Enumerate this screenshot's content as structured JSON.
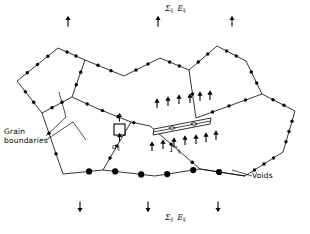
{
  "figure": {
    "type": "micromechanics-schematic",
    "width": 310,
    "height": 234,
    "background_color": "#ffffff",
    "line_color": "#000000"
  },
  "labels": {
    "top_load": {
      "stress_symbol": "Σ",
      "stress_sub": "ij",
      "strain_symbol": "E",
      "strain_sub": "ij"
    },
    "bottom_load": {
      "stress_symbol": "Σ",
      "stress_sub": "ij",
      "strain_symbol": "E",
      "strain_sub": "ij"
    },
    "grain_boundaries": {
      "line1": "Grain",
      "line2": "boundaries"
    },
    "voids": "Voids",
    "facet_band": {
      "symbol": "Γ",
      "sup": "*",
      "sub": "ij"
    },
    "local_stress": {
      "symbol": "σ",
      "sub": "ij"
    }
  },
  "legend_semantics": {
    "small_dots": "grain boundary cavity nuclei",
    "large_dots": "voids",
    "thin_band": "cavitating facet Γ*ij",
    "square": "representative volume element under local stress σij",
    "outer_arrows": "remote applied loading Σij / Eij",
    "band_arrows": "tractions on the cavitating facet"
  },
  "counts": {
    "top_load_arrows": 3,
    "bottom_load_arrows": 3,
    "grains": 5,
    "band_cavities": 2,
    "band_arrows_above": 6,
    "band_arrows_below": 7,
    "large_voids": 6
  },
  "geometry": {
    "grain_polygons": [
      {
        "name": "grain-upper-left",
        "points": "17,81 58,48 85,60 72,97 42,113"
      },
      {
        "name": "grain-lower-left",
        "points": "42,113 72,97 96,108 131,122 103,170 63,174"
      },
      {
        "name": "grain-center",
        "points": "85,60 124,76 160,58 189,70 196,118 150,126 131,122 96,108 72,97"
      },
      {
        "name": "grain-upper-right",
        "points": "189,70 217,46 246,61 262,94 219,108 196,118"
      },
      {
        "name": "grain-lower-right",
        "points": "196,118 262,94 295,111 283,152 245,176 200,169 150,126"
      }
    ],
    "boundary_edges": [
      {
        "name": "gb-edge-1",
        "path": "M17,81 L58,48",
        "node_count": 3
      },
      {
        "name": "gb-edge-2",
        "path": "M58,48 L85,60",
        "node_count": 2
      },
      {
        "name": "gb-edge-3",
        "path": "M85,60 L72,97",
        "node_count": 2
      },
      {
        "name": "gb-edge-4",
        "path": "M72,97 L42,113",
        "node_count": 2
      },
      {
        "name": "gb-edge-5",
        "path": "M42,113 L17,81",
        "node_count": 2
      },
      {
        "name": "gb-edge-6",
        "path": "M85,60 L124,76",
        "node_count": 2
      },
      {
        "name": "gb-edge-7",
        "path": "M124,76 L160,58",
        "node_count": 2
      },
      {
        "name": "gb-edge-8",
        "path": "M160,58 L189,70",
        "node_count": 2
      },
      {
        "name": "gb-edge-9",
        "path": "M189,70 L196,118",
        "node_count": 1
      },
      {
        "name": "gb-edge-10",
        "path": "M72,97 L96,108 L131,122 L150,126",
        "node_count": 4
      },
      {
        "name": "gb-edge-11",
        "path": "M189,70 L217,46",
        "node_count": 2
      },
      {
        "name": "gb-edge-12",
        "path": "M217,46 L246,61",
        "node_count": 2
      },
      {
        "name": "gb-edge-13",
        "path": "M246,61 L262,94",
        "node_count": 2
      },
      {
        "name": "gb-edge-14",
        "path": "M262,94 L196,118",
        "node_count": 3
      },
      {
        "name": "gb-edge-15",
        "path": "M262,94 L295,111",
        "node_count": 2
      },
      {
        "name": "gb-edge-16",
        "path": "M295,111 L283,152",
        "node_count": 3
      },
      {
        "name": "gb-edge-17",
        "path": "M283,152 L245,176",
        "node_count": 3
      },
      {
        "name": "gb-edge-18",
        "path": "M150,126 L200,169 L245,176",
        "node_count": 3
      },
      {
        "name": "gb-edge-19",
        "path": "M131,122 L103,170",
        "node_count": 3
      },
      {
        "name": "gb-edge-20",
        "path": "M42,113 L63,174",
        "node_count": 2
      },
      {
        "name": "gb-bottom-void-run",
        "path": "M63,174 L103,170 L155,176 L200,169 L245,176",
        "node_count": 0
      }
    ],
    "band": {
      "name": "cavitating-facet-band",
      "outer": "153,135 210,124 211,118 154,129",
      "mid_line": "M153.5,132 L210.5,121",
      "cavity_markers": [
        {
          "cx": 172,
          "cy": 128
        },
        {
          "cx": 194,
          "cy": 124
        }
      ]
    },
    "rve_square": {
      "x": 114,
      "y": 124,
      "size": 11
    },
    "leader_lines": [
      {
        "name": "grain-boundaries-leader-1",
        "path": "M46,136 L66,117 L59,92"
      },
      {
        "name": "grain-boundaries-leader-2",
        "path": "M46,140 L73,122 L86,140"
      },
      {
        "name": "voids-leader",
        "path": "M252,176 L232,170"
      }
    ],
    "load_arrows_top": [
      {
        "x": 68,
        "y": 22
      },
      {
        "x": 158,
        "y": 22
      },
      {
        "x": 232,
        "y": 22
      }
    ],
    "load_arrows_bottom": [
      {
        "x": 80,
        "y": 206
      },
      {
        "x": 148,
        "y": 206
      },
      {
        "x": 218,
        "y": 206
      }
    ],
    "rve_arrows": [
      {
        "x": 119.5,
        "y": 118,
        "dir": "up"
      },
      {
        "x": 119.5,
        "y": 138,
        "dir": "up"
      }
    ],
    "band_arrows_above": [
      {
        "x": 157,
        "y": 104
      },
      {
        "x": 168,
        "y": 102
      },
      {
        "x": 179,
        "y": 100
      },
      {
        "x": 190,
        "y": 99
      },
      {
        "x": 200,
        "y": 97
      },
      {
        "x": 210,
        "y": 96
      }
    ],
    "band_arrows_below": [
      {
        "x": 152,
        "y": 147
      },
      {
        "x": 163,
        "y": 145
      },
      {
        "x": 174,
        "y": 143
      },
      {
        "x": 185,
        "y": 141
      },
      {
        "x": 196,
        "y": 140
      },
      {
        "x": 206,
        "y": 138
      },
      {
        "x": 216,
        "y": 136
      }
    ]
  }
}
